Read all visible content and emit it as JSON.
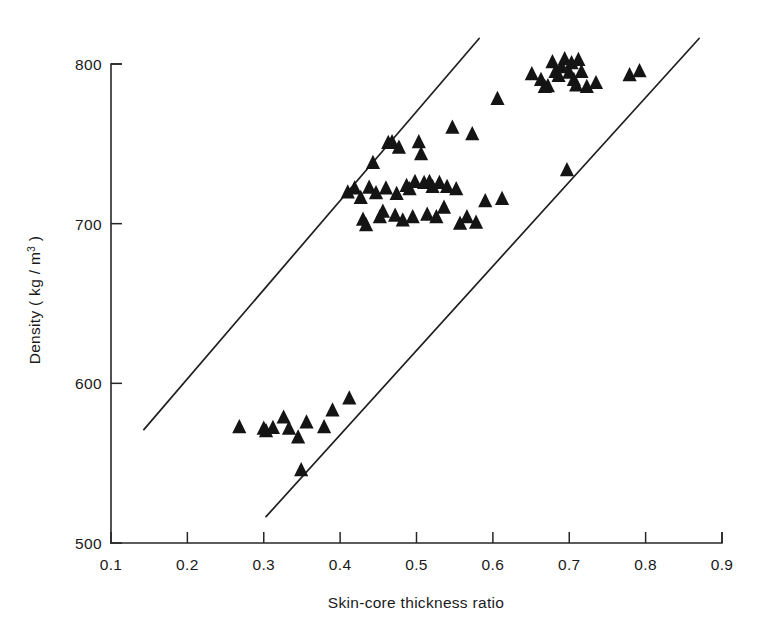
{
  "chart_data": {
    "type": "scatter",
    "title": "",
    "xlabel": "Skin-core thickness ratio",
    "ylabel": "Density ( kg / m3 )",
    "ylabel_base": "Density  ( kg / m",
    "ylabel_exponent": "3",
    "ylabel_close": " )",
    "xlim": [
      0.1,
      0.9
    ],
    "ylim": [
      500,
      800
    ],
    "xticks": [
      0.1,
      0.2,
      0.3,
      0.4,
      0.5,
      0.6,
      0.7,
      0.8,
      0.9
    ],
    "xtick_labels": [
      "0.1",
      "0.2",
      "0.3",
      "0.4",
      "0.5",
      "0.6",
      "0.7",
      "0.8",
      "0.9"
    ],
    "yticks": [
      500,
      600,
      700,
      800
    ],
    "ytick_labels": [
      "500",
      "600",
      "700",
      "800"
    ],
    "grid": false,
    "legend": "none",
    "marker": "triangle-up",
    "marker_color": "#141414",
    "marker_size": 9,
    "axis_color": "#262626",
    "background": "#ffffff",
    "series": [
      {
        "name": "Specimens",
        "points": [
          [
            0.268,
            572.5
          ],
          [
            0.3,
            571.5
          ],
          [
            0.303,
            570.0
          ],
          [
            0.312,
            572.0
          ],
          [
            0.326,
            578.5
          ],
          [
            0.333,
            571.5
          ],
          [
            0.345,
            566.0
          ],
          [
            0.349,
            545.5
          ],
          [
            0.356,
            575.5
          ],
          [
            0.379,
            572.5
          ],
          [
            0.39,
            583.0
          ],
          [
            0.412,
            590.5
          ],
          [
            0.41,
            719.5
          ],
          [
            0.419,
            722.0
          ],
          [
            0.427,
            716.0
          ],
          [
            0.43,
            702.5
          ],
          [
            0.434,
            699.0
          ],
          [
            0.438,
            722.5
          ],
          [
            0.443,
            738.0
          ],
          [
            0.447,
            719.0
          ],
          [
            0.452,
            704.0
          ],
          [
            0.456,
            707.5
          ],
          [
            0.46,
            722.0
          ],
          [
            0.463,
            750.5
          ],
          [
            0.468,
            751.0
          ],
          [
            0.472,
            705.0
          ],
          [
            0.474,
            718.5
          ],
          [
            0.477,
            747.5
          ],
          [
            0.482,
            702.0
          ],
          [
            0.487,
            723.5
          ],
          [
            0.491,
            721.5
          ],
          [
            0.495,
            704.0
          ],
          [
            0.498,
            726.0
          ],
          [
            0.503,
            751.0
          ],
          [
            0.506,
            743.5
          ],
          [
            0.51,
            725.5
          ],
          [
            0.514,
            705.5
          ],
          [
            0.517,
            726.0
          ],
          [
            0.521,
            723.0
          ],
          [
            0.526,
            704.0
          ],
          [
            0.53,
            725.5
          ],
          [
            0.536,
            710.0
          ],
          [
            0.54,
            723.0
          ],
          [
            0.547,
            760.0
          ],
          [
            0.552,
            721.5
          ],
          [
            0.557,
            700.0
          ],
          [
            0.566,
            704.0
          ],
          [
            0.573,
            756.0
          ],
          [
            0.578,
            700.5
          ],
          [
            0.59,
            714.0
          ],
          [
            0.606,
            778.0
          ],
          [
            0.612,
            715.5
          ],
          [
            0.651,
            793.5
          ],
          [
            0.663,
            790.0
          ],
          [
            0.668,
            785.5
          ],
          [
            0.672,
            786.0
          ],
          [
            0.678,
            801.0
          ],
          [
            0.682,
            795.0
          ],
          [
            0.686,
            792.5
          ],
          [
            0.69,
            798.0
          ],
          [
            0.694,
            803.0
          ],
          [
            0.697,
            733.5
          ],
          [
            0.7,
            794.5
          ],
          [
            0.703,
            800.5
          ],
          [
            0.706,
            790.0
          ],
          [
            0.709,
            786.5
          ],
          [
            0.712,
            802.5
          ],
          [
            0.716,
            795.0
          ],
          [
            0.723,
            785.5
          ],
          [
            0.735,
            788.0
          ],
          [
            0.779,
            793.0
          ],
          [
            0.792,
            795.5
          ]
        ]
      }
    ],
    "boundary_lines": [
      {
        "name": "upper-bound-line",
        "x1": 0.143,
        "y1": 571.0,
        "x2": 0.582,
        "y2": 816.0
      },
      {
        "name": "lower-bound-line",
        "x1": 0.303,
        "y1": 516.5,
        "x2": 0.87,
        "y2": 816.0
      }
    ]
  }
}
